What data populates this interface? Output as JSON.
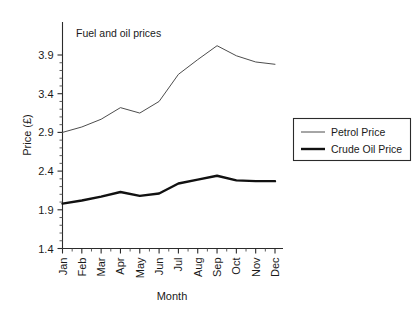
{
  "chart_data": {
    "type": "line",
    "title": "Fuel and oil prices",
    "xlabel": "Month",
    "ylabel": "Price (£)",
    "categories": [
      "Jan",
      "Feb",
      "Mar",
      "Apr",
      "May",
      "Jun",
      "Jul",
      "Aug",
      "Sep",
      "Oct",
      "Nov",
      "Dec"
    ],
    "ylim": [
      1.4,
      3.9
    ],
    "ytick_labels": [
      "1.4",
      "1.9",
      "2.4",
      "2.9",
      "3.4",
      "3.9"
    ],
    "ytick_values": [
      1.4,
      1.9,
      2.4,
      2.9,
      3.4,
      3.9
    ],
    "y_minor_tick_step": 0.1,
    "x_minor_ticks_between_majors": 1,
    "grid": false,
    "legend_position": "right-outside",
    "series": [
      {
        "name": "Petrol Price",
        "style": "thin-line",
        "color": "#4d4d4d",
        "values": [
          2.9,
          2.97,
          3.07,
          3.22,
          3.15,
          3.3,
          3.65,
          3.84,
          4.02,
          3.89,
          3.81,
          3.78
        ]
      },
      {
        "name": "Crude Oil Price",
        "style": "thick-line",
        "color": "#111111",
        "values": [
          1.98,
          2.02,
          2.07,
          2.13,
          2.08,
          2.11,
          2.24,
          2.29,
          2.34,
          2.28,
          2.27,
          2.27
        ]
      }
    ]
  },
  "legend": {
    "entries": [
      {
        "label": "Petrol Price"
      },
      {
        "label": "Crude Oil Price"
      }
    ]
  }
}
